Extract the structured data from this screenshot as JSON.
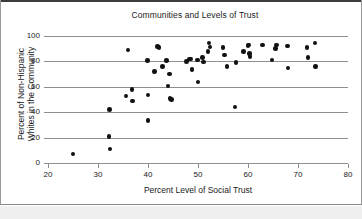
{
  "figure": {
    "width": 362,
    "height": 219,
    "background": "#ffffff",
    "border_color": "#3c3c3c",
    "footer_color": "#efefef"
  },
  "chart_data": {
    "type": "scatter",
    "title": "Communities and Levels of Trust",
    "xlabel": "Percent Level of Social Trust",
    "ylabel": "Percent of Non-Hispanic Whites in the Community",
    "ylabel_line1": "Percent of Non-Hispanic",
    "ylabel_line2": "Whites in the Community",
    "xlim": [
      20,
      80
    ],
    "ylim": [
      0,
      100
    ],
    "xticks": [
      20,
      30,
      40,
      50,
      60,
      70,
      80
    ],
    "yticks": [
      0,
      20,
      40,
      60,
      80,
      100
    ],
    "grid": "horizontal",
    "legend": "none",
    "marker_color": "#111111",
    "marker_size": 4.6,
    "points": [
      [
        25.0,
        7.0
      ],
      [
        32.2,
        20.8
      ],
      [
        32.4,
        11.0
      ],
      [
        32.3,
        42.0
      ],
      [
        35.6,
        52.8
      ],
      [
        36.0,
        89.0
      ],
      [
        36.8,
        58.0
      ],
      [
        36.9,
        48.8
      ],
      [
        39.9,
        80.6
      ],
      [
        40.0,
        53.5
      ],
      [
        40.0,
        33.5
      ],
      [
        41.3,
        72.0
      ],
      [
        41.9,
        91.5
      ],
      [
        42.2,
        91.0
      ],
      [
        42.9,
        76.0
      ],
      [
        43.7,
        80.5
      ],
      [
        44.0,
        60.6
      ],
      [
        44.3,
        70.0
      ],
      [
        44.4,
        51.0
      ],
      [
        44.7,
        50.2
      ],
      [
        47.7,
        80.0
      ],
      [
        48.3,
        81.8
      ],
      [
        48.6,
        82.0
      ],
      [
        48.8,
        73.5
      ],
      [
        49.9,
        81.0
      ],
      [
        50.0,
        63.8
      ],
      [
        50.9,
        83.0
      ],
      [
        51.1,
        79.5
      ],
      [
        52.0,
        88.0
      ],
      [
        52.2,
        94.5
      ],
      [
        52.4,
        91.2
      ],
      [
        55.0,
        91.0
      ],
      [
        55.3,
        85.0
      ],
      [
        55.8,
        76.0
      ],
      [
        57.4,
        44.0
      ],
      [
        57.6,
        79.0
      ],
      [
        59.1,
        88.0
      ],
      [
        60.0,
        92.5
      ],
      [
        60.2,
        93.0
      ],
      [
        60.3,
        86.2
      ],
      [
        60.4,
        84.0
      ],
      [
        62.9,
        93.0
      ],
      [
        64.8,
        81.0
      ],
      [
        65.5,
        90.0
      ],
      [
        65.7,
        93.0
      ],
      [
        67.9,
        92.0
      ],
      [
        68.0,
        74.8
      ],
      [
        71.8,
        91.0
      ],
      [
        72.0,
        83.0
      ],
      [
        73.4,
        94.5
      ],
      [
        73.5,
        76.0
      ]
    ]
  }
}
